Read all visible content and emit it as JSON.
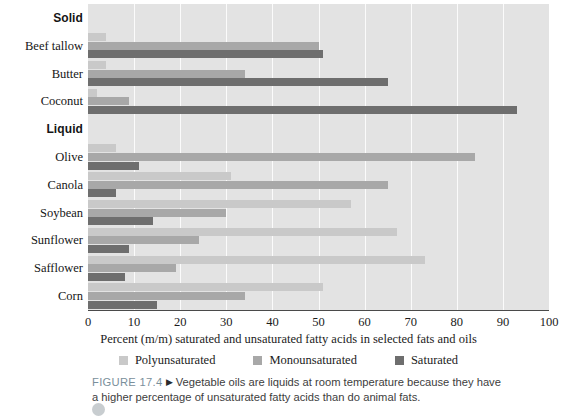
{
  "chart_data": {
    "type": "bar",
    "orientation": "horizontal",
    "title": "",
    "xlabel": "Percent (m/m) saturated and unsaturated fatty acids in selected fats and oils",
    "ylabel": "",
    "xlim": [
      0,
      100
    ],
    "xticks": [
      0,
      10,
      20,
      30,
      40,
      50,
      60,
      70,
      80,
      90,
      100
    ],
    "grid": true,
    "grid_axis": "x",
    "legend_position": "bottom",
    "groups": [
      {
        "name": "Solid",
        "categories": [
          "Beef tallow",
          "Butter",
          "Coconut"
        ]
      },
      {
        "name": "Liquid",
        "categories": [
          "Olive",
          "Canola",
          "Soybean",
          "Sunflower",
          "Safflower",
          "Corn"
        ]
      }
    ],
    "categories": [
      "Beef tallow",
      "Butter",
      "Coconut",
      "Olive",
      "Canola",
      "Soybean",
      "Sunflower",
      "Safflower",
      "Corn"
    ],
    "series": [
      {
        "name": "Polyunsaturated",
        "color": "#c9c9c9",
        "values": [
          4,
          4,
          2,
          6,
          31,
          57,
          67,
          73,
          51
        ]
      },
      {
        "name": "Monounsaturated",
        "color": "#a8a8a8",
        "values": [
          50,
          34,
          9,
          84,
          65,
          30,
          24,
          19,
          34
        ]
      },
      {
        "name": "Saturated",
        "color": "#6e6e6e",
        "values": [
          51,
          65,
          93,
          11,
          6,
          14,
          9,
          8,
          15
        ]
      }
    ]
  },
  "axis": {
    "tick_labels": [
      "0",
      "10",
      "20",
      "30",
      "40",
      "50",
      "60",
      "70",
      "80",
      "90",
      "100"
    ],
    "title": "Percent (m/m) saturated and unsaturated fatty acids in selected fats and oils"
  },
  "legend": {
    "items": [
      {
        "label": "Polyunsaturated",
        "color": "#c9c9c9"
      },
      {
        "label": "Monounsaturated",
        "color": "#a8a8a8"
      },
      {
        "label": "Saturated",
        "color": "#6e6e6e"
      }
    ]
  },
  "rows": [
    {
      "label": "Solid",
      "kind": "group"
    },
    {
      "label": "Beef tallow",
      "kind": "category"
    },
    {
      "label": "Butter",
      "kind": "category"
    },
    {
      "label": "Coconut",
      "kind": "category"
    },
    {
      "label": "Liquid",
      "kind": "group"
    },
    {
      "label": "Olive",
      "kind": "category"
    },
    {
      "label": "Canola",
      "kind": "category"
    },
    {
      "label": "Soybean",
      "kind": "category"
    },
    {
      "label": "Sunflower",
      "kind": "category"
    },
    {
      "label": "Safflower",
      "kind": "category"
    },
    {
      "label": "Corn",
      "kind": "category"
    }
  ],
  "caption": {
    "figure_number": "FIGURE 17.4",
    "marker": "▶",
    "text": "Vegetable oils are liquids at room temperature because they have a higher percentage of unsaturated fatty acids than do animal fats."
  }
}
